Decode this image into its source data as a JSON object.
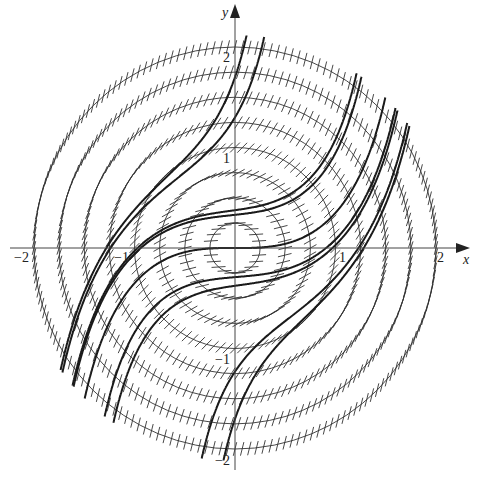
{
  "figure": {
    "equation": "dy/dx = x^2 + y^2",
    "axes": {
      "x_label": "x",
      "y_label": "y",
      "x_ticks": [
        {
          "value": -2,
          "label": "−2"
        },
        {
          "value": -1,
          "label": "−1"
        },
        {
          "value": 1,
          "label": "1"
        },
        {
          "value": 2,
          "label": "2"
        }
      ],
      "y_ticks": [
        {
          "value": 2,
          "label": "2"
        },
        {
          "value": 1,
          "label": "1"
        },
        {
          "value": -1,
          "label": "−1"
        },
        {
          "value": -2,
          "label": "−2"
        }
      ],
      "range": [
        -2.2,
        2.2
      ]
    },
    "isocline_radii": [
      0.25,
      0.5,
      0.75,
      1.0,
      1.25,
      1.5,
      1.75,
      2.0
    ],
    "segments_per_unit_arc": 14,
    "solution_initial_points": [
      [
        0,
        0
      ],
      [
        0,
        0.33
      ],
      [
        0,
        -0.29
      ],
      [
        0,
        1.3
      ],
      [
        0,
        -1.23
      ],
      [
        0.97,
        0
      ],
      [
        1.28,
        0
      ],
      [
        -0.97,
        0
      ],
      [
        -1.28,
        0
      ]
    ],
    "colors": {
      "background": "#ffffff",
      "ink": "#1a1a1a",
      "isocline": "#333333"
    }
  }
}
